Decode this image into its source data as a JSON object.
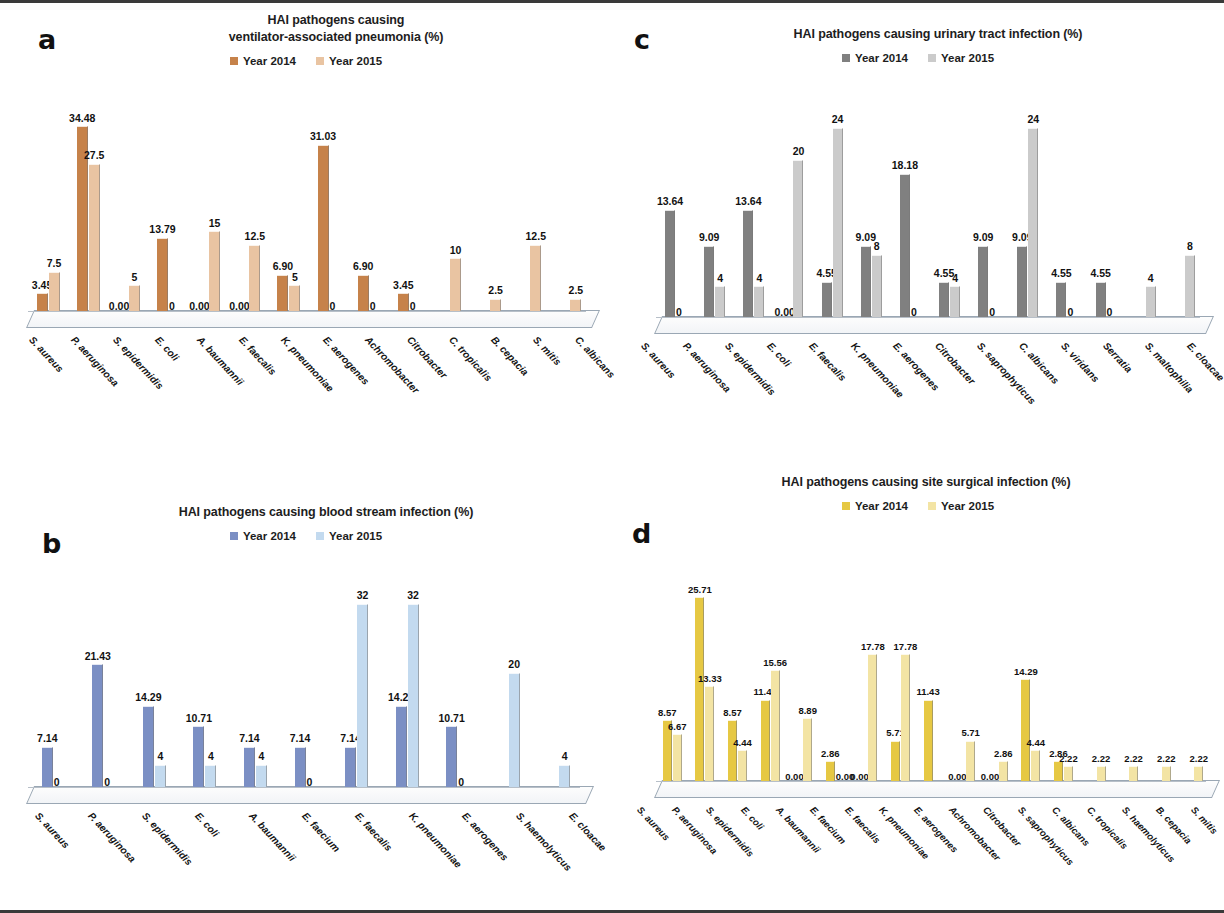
{
  "figure": {
    "panels": [
      "a",
      "b",
      "c",
      "d"
    ]
  },
  "panel_a": {
    "letter": "a",
    "title_line1": "HAI pathogens causing",
    "title_line2": "ventilator-associated pneumonia (%)",
    "legend": [
      {
        "label": "Year 2014",
        "color": "#C6824A"
      },
      {
        "label": "Year 2015",
        "color": "#E9C4A2"
      }
    ]
  },
  "panel_b": {
    "letter": "b",
    "title_line1": "HAI pathogens causing blood stream infection (%)",
    "title_line2": "",
    "legend": [
      {
        "label": "Year 2014",
        "color": "#7B8FC4"
      },
      {
        "label": "Year 2015",
        "color": "#C3DAEF"
      }
    ]
  },
  "panel_c": {
    "letter": "c",
    "title_line1": "HAI pathogens causing urinary tract infection (%)",
    "title_line2": "",
    "legend": [
      {
        "label": "Year 2014",
        "color": "#808080"
      },
      {
        "label": "Year 2015",
        "color": "#CBCBCB"
      }
    ]
  },
  "panel_d": {
    "letter": "d",
    "title_line1": "HAI pathogens causing site surgical infection (%)",
    "title_line2": "",
    "legend": [
      {
        "label": "Year 2014",
        "color": "#E6C843"
      },
      {
        "label": "Year 2015",
        "color": "#F3E4A4"
      }
    ]
  },
  "chart_data": [
    {
      "id": "a",
      "type": "bar",
      "title": "HAI pathogens causing ventilator-associated pneumonia (%)",
      "xlabel": "",
      "ylabel": "",
      "ylim": [
        0,
        36
      ],
      "grid": false,
      "legend_position": "top",
      "categories": [
        "S. aureus",
        "P. aeruginosa",
        "S. epidermidis",
        "E. coli",
        "A. baumannii",
        "E. faecalis",
        "K. pneumoniae",
        "E. aerogenes",
        "Achromobacter",
        "Citrobacter",
        "C. tropicalis",
        "B. cepacia",
        "S. mitis",
        "C. albicans"
      ],
      "series": [
        {
          "name": "Year 2014",
          "color": "#C6824A",
          "values": [
            3.45,
            34.48,
            0.0,
            13.79,
            0.0,
            0.0,
            6.9,
            31.03,
            6.9,
            3.45,
            0,
            0,
            0,
            0
          ],
          "labels": [
            "3.45",
            "34.48",
            "0.00",
            "13.79",
            "0.00",
            "0.00",
            "6.90",
            "31.03",
            "6.90",
            "3.45",
            "",
            "",
            "",
            ""
          ]
        },
        {
          "name": "Year 2015",
          "color": "#E9C4A2",
          "values": [
            7.5,
            27.5,
            5,
            0,
            15,
            12.5,
            5,
            0,
            0,
            0,
            10,
            2.5,
            12.5,
            2.5
          ],
          "labels": [
            "7.5",
            "27.5",
            "5",
            "0",
            "15",
            "12.5",
            "5",
            "0",
            "0",
            "0",
            "10",
            "2.5",
            "12.5",
            "2.5"
          ]
        }
      ]
    },
    {
      "id": "b",
      "type": "bar",
      "title": "HAI pathogens causing blood stream infection (%)",
      "xlabel": "",
      "ylabel": "",
      "ylim": [
        0,
        34
      ],
      "grid": false,
      "legend_position": "top",
      "categories": [
        "S. aureus",
        "P. aeruginosa",
        "S. epidermidis",
        "E. coli",
        "A. baumannii",
        "E. faecium",
        "E. faecalis",
        "K. pneumoniae",
        "E. aerogenes",
        "S. haemolyticus",
        "E. cloacae"
      ],
      "series": [
        {
          "name": "Year 2014",
          "color": "#7B8FC4",
          "values": [
            7.14,
            21.43,
            14.29,
            10.71,
            7.14,
            7.14,
            7.14,
            14.29,
            10.71,
            0,
            0
          ],
          "labels": [
            "7.14",
            "21.43",
            "14.29",
            "10.71",
            "7.14",
            "7.14",
            "7.14",
            "14.29",
            "10.71",
            "",
            ""
          ]
        },
        {
          "name": "Year 2015",
          "color": "#C3DAEF",
          "values": [
            0,
            0,
            4,
            4,
            4,
            0,
            32,
            32,
            0,
            20,
            4
          ],
          "labels": [
            "0",
            "0",
            "4",
            "4",
            "4",
            "0",
            "32",
            "32",
            "0",
            "20",
            "4"
          ]
        }
      ]
    },
    {
      "id": "c",
      "type": "bar",
      "title": "HAI pathogens causing urinary tract infection (%)",
      "xlabel": "",
      "ylabel": "",
      "ylim": [
        0,
        26
      ],
      "grid": false,
      "legend_position": "top",
      "categories": [
        "S. aureus",
        "P. aeruginosa",
        "S. epidermidis",
        "E. coli",
        "E. faecalis",
        "K. pneumoniae",
        "E. aerogenes",
        "Citrobacter",
        "S. saprophyticus",
        "C. albicans",
        "S. viridans",
        "Serratia",
        "S. maltophilia",
        "E. cloacae"
      ],
      "series": [
        {
          "name": "Year 2014",
          "color": "#808080",
          "values": [
            13.64,
            9.09,
            13.64,
            0.0,
            4.55,
            9.09,
            18.18,
            4.55,
            9.09,
            9.09,
            4.55,
            4.55,
            0,
            0
          ],
          "labels": [
            "13.64",
            "9.09",
            "13.64",
            "0.00",
            "4.55",
            "9.09",
            "18.18",
            "4.55",
            "9.09",
            "9.09",
            "4.55",
            "4.55",
            "",
            ""
          ]
        },
        {
          "name": "Year 2015",
          "color": "#CBCBCB",
          "values": [
            0,
            4,
            4,
            20,
            24,
            8,
            0,
            4,
            0,
            24,
            0,
            0,
            4,
            8
          ],
          "labels": [
            "0",
            "4",
            "4",
            "20",
            "24",
            "8",
            "0",
            "4",
            "0",
            "24",
            "0",
            "0",
            "4",
            "8"
          ]
        }
      ]
    },
    {
      "id": "d",
      "type": "bar",
      "title": "HAI pathogens causing site surgical infection (%)",
      "xlabel": "",
      "ylabel": "",
      "ylim": [
        0,
        27
      ],
      "grid": false,
      "legend_position": "top",
      "categories": [
        "S. aureus",
        "P. aeruginosa",
        "S. epidermidis",
        "E. coli",
        "A. baumannii",
        "E. faecium",
        "E. faecalis",
        "K. pneumoniae",
        "E. aerogenes",
        "Achromobacter",
        "Citrobacter",
        "S. saprophyticus",
        "C. albicans",
        "C. tropicalis",
        "S. haemolyticus",
        "B. cepacia",
        "S. mitis"
      ],
      "series": [
        {
          "name": "Year 2014",
          "color": "#E6C843",
          "values": [
            8.57,
            25.71,
            8.57,
            11.43,
            0.0,
            2.86,
            0.0,
            5.71,
            11.43,
            0.0,
            0.0,
            14.29,
            2.86,
            0,
            0,
            0,
            0
          ],
          "labels": [
            "8.57",
            "25.71",
            "8.57",
            "11.43",
            "0.00",
            "2.86",
            "0.00",
            "5.71",
            "11.43",
            "0.00",
            "0.00",
            "14.29",
            "2.86",
            "",
            "",
            "",
            ""
          ]
        },
        {
          "name": "Year 2015",
          "color": "#F3E4A4",
          "values": [
            6.67,
            13.33,
            4.44,
            15.56,
            8.89,
            0.0,
            17.78,
            17.78,
            0,
            5.71,
            2.86,
            4.44,
            2.22,
            2.22,
            2.22,
            2.22,
            2.22
          ],
          "labels": [
            "6.67",
            "13.33",
            "4.44",
            "15.56",
            "8.89",
            "0.00",
            "17.78",
            "17.78",
            "",
            "5.71",
            "2.86",
            "4.44",
            "2.22",
            "2.22",
            "2.22",
            "2.22",
            "2.22"
          ]
        }
      ]
    }
  ]
}
